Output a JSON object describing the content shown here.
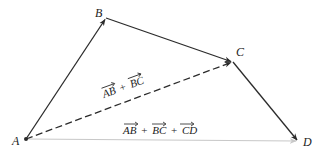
{
  "diagram": {
    "colors": {
      "solid_vector": "#2b2b2b",
      "dashed_vector": "#2b2b2b",
      "resultant_vector": "#c8c8c8",
      "text": "#222222"
    },
    "points": [
      {
        "id": "A",
        "label": "A",
        "x": 26,
        "y": 139
      },
      {
        "id": "B",
        "label": "B",
        "x": 106,
        "y": 18
      },
      {
        "id": "C",
        "label": "C",
        "x": 233,
        "y": 62
      },
      {
        "id": "D",
        "label": "D",
        "x": 298,
        "y": 141
      }
    ],
    "vectors": [
      {
        "id": "AB",
        "from": "A",
        "to": "B",
        "style": "solid"
      },
      {
        "id": "BC",
        "from": "B",
        "to": "C",
        "style": "solid"
      },
      {
        "id": "CD",
        "from": "C",
        "to": "D",
        "style": "solid"
      },
      {
        "id": "AC",
        "from": "A",
        "to": "C",
        "style": "dashed",
        "label": "AB + BC"
      },
      {
        "id": "AD",
        "from": "A",
        "to": "D",
        "style": "light",
        "label": "AB + BC + CD"
      }
    ],
    "labels": {
      "point_A": "A",
      "point_B": "B",
      "point_C": "C",
      "point_D": "D",
      "sum_ac": {
        "t1": "AB",
        "op1": "+",
        "t2": "BC"
      },
      "sum_ad": {
        "t1": "AB",
        "op1": "+",
        "t2": "BC",
        "op2": "+",
        "t3": "CD"
      }
    }
  }
}
